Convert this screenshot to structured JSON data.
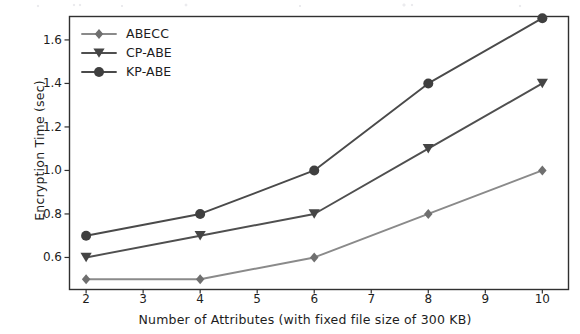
{
  "figure": {
    "background_color": "#ffffff",
    "frame_color": "#303030",
    "scan_artifact": true
  },
  "chart_data": {
    "type": "line",
    "title": "",
    "xlabel": "Number of Attributes (with fixed file size of 300 KB)",
    "ylabel": "Encryption Time (sec)",
    "x": [
      2,
      4,
      6,
      8,
      10
    ],
    "xticks": [
      2,
      3,
      4,
      5,
      6,
      7,
      8,
      9,
      10
    ],
    "xtick_labels": [
      "2",
      "3",
      "4",
      "5",
      "6",
      "7",
      "8",
      "9",
      "10"
    ],
    "yticks": [
      0.6,
      0.8,
      1.0,
      1.2,
      1.4,
      1.6
    ],
    "ytick_labels": [
      "0.6",
      "0.8",
      "1.0",
      "1.2",
      "1.4",
      "1.6"
    ],
    "xlim": [
      1.7,
      10.45
    ],
    "ylim": [
      0.455,
      1.71
    ],
    "grid": false,
    "legend_position": "upper left",
    "series": [
      {
        "name": "ABECC",
        "values": [
          0.5,
          0.5,
          0.6,
          0.8,
          1.0
        ],
        "marker": "diamond",
        "color": "#8a8a8a",
        "marker_color": "#6f6f6f"
      },
      {
        "name": "CP-ABE",
        "values": [
          0.6,
          0.7,
          0.8,
          1.1,
          1.4
        ],
        "marker": "triangle-down",
        "color": "#4f4f4f",
        "marker_color": "#454545"
      },
      {
        "name": "KP-ABE",
        "values": [
          0.7,
          0.8,
          1.0,
          1.4,
          1.7
        ],
        "marker": "circle",
        "color": "#4a4a4a",
        "marker_color": "#3f3f3f"
      }
    ]
  }
}
